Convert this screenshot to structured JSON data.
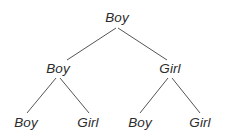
{
  "figure": {
    "type": "binary-tree-diagram",
    "background_color": "#ffffff",
    "line_color": "#555555",
    "text_color": "#2b2b2b",
    "width": 229,
    "height": 138
  },
  "tree": {
    "root": {
      "label": "Boy",
      "x": 117,
      "y": 18,
      "level": 0
    },
    "level2": [
      {
        "label": "Boy",
        "x": 58,
        "y": 69,
        "level": 1,
        "position": "left"
      },
      {
        "label": "Girl",
        "x": 170,
        "y": 69,
        "level": 1,
        "position": "right"
      }
    ],
    "leaves": [
      {
        "label": "Boy",
        "x": 26,
        "y": 123,
        "level": 2,
        "position": "left-left"
      },
      {
        "label": "Girl",
        "x": 88,
        "y": 123,
        "level": 2,
        "position": "left-right"
      },
      {
        "label": "Boy",
        "x": 140,
        "y": 123,
        "level": 2,
        "position": "right-left"
      },
      {
        "label": "Girl",
        "x": 200,
        "y": 123,
        "level": 2,
        "position": "right-right"
      }
    ],
    "edges": [
      {
        "name": "root-to-left",
        "x1": 116,
        "y1": 28,
        "x2": 67,
        "y2": 60
      },
      {
        "name": "root-to-right",
        "x1": 118,
        "y1": 28,
        "x2": 167,
        "y2": 60
      },
      {
        "name": "left-to-left-left",
        "x1": 56,
        "y1": 78,
        "x2": 27,
        "y2": 113
      },
      {
        "name": "left-to-left-right",
        "x1": 60,
        "y1": 78,
        "x2": 89,
        "y2": 113
      },
      {
        "name": "right-to-right-left",
        "x1": 168,
        "y1": 78,
        "x2": 140,
        "y2": 113
      },
      {
        "name": "right-to-right-right",
        "x1": 172,
        "y1": 78,
        "x2": 200,
        "y2": 113
      }
    ]
  }
}
